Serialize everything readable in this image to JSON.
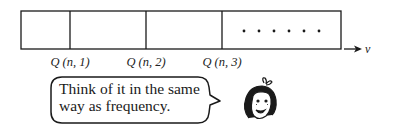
{
  "diagram": {
    "segments": [
      {
        "label": "Q (n, 1)"
      },
      {
        "label": "Q (n, 2)"
      },
      {
        "label": "Q (n, 3)"
      }
    ],
    "continuation": "• • • • • •",
    "axis_label": "ν"
  },
  "speech_bubble": {
    "line1": "Think of it in the same",
    "line2": "way as frequency."
  },
  "character": {
    "icon": "girl-face-icon"
  },
  "colors": {
    "stroke": "#1a1a1a",
    "background": "#ffffff"
  }
}
